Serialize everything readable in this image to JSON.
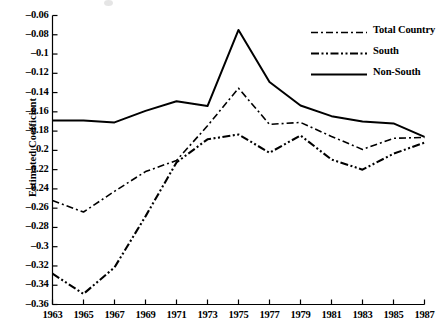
{
  "chart_data": {
    "type": "line",
    "title": "",
    "subtitle": "",
    "xlabel": "",
    "ylabel": "Estimated Coefficient",
    "x": [
      1963,
      1965,
      1967,
      1969,
      1971,
      1973,
      1975,
      1977,
      1979,
      1981,
      1983,
      1985,
      1987
    ],
    "xtick_labels": [
      "1963",
      "1965",
      "1967",
      "1969",
      "1971",
      "1973",
      "1975",
      "1977",
      "1979",
      "1981",
      "1983",
      "1985",
      "1987"
    ],
    "ytick_labels": [
      "-0.06",
      "-0.08",
      "-0.1",
      "-0.12",
      "-0.14",
      "-0.16",
      "-0.18",
      "-0.2",
      "-0.22",
      "-0.24",
      "-0.26",
      "-0.28",
      "-0.3",
      "-0.32",
      "-0.34",
      "-0.36"
    ],
    "ytick_values": [
      -0.06,
      -0.08,
      -0.1,
      -0.12,
      -0.14,
      -0.16,
      -0.18,
      -0.2,
      -0.22,
      -0.24,
      -0.26,
      -0.28,
      -0.3,
      -0.32,
      -0.34,
      -0.36
    ],
    "xlim": [
      1963,
      1987
    ],
    "ylim": [
      -0.36,
      -0.06
    ],
    "grid": false,
    "legend_position": "top-right",
    "series": [
      {
        "name": "Total Country",
        "style": "dash-dot",
        "color": "#000000",
        "width": 1.6,
        "values": [
          -0.252,
          -0.264,
          -0.2425,
          -0.222,
          -0.2105,
          -0.1745,
          -0.1355,
          -0.173,
          -0.171,
          -0.1855,
          -0.199,
          -0.1875,
          -0.1865
        ]
      },
      {
        "name": "South",
        "style": "dash-dot-dot",
        "color": "#000000",
        "width": 2.1,
        "values": [
          -0.328,
          -0.349,
          -0.3215,
          -0.2685,
          -0.2125,
          -0.1885,
          -0.1835,
          -0.2025,
          -0.1845,
          -0.2095,
          -0.22,
          -0.2035,
          -0.192
        ]
      },
      {
        "name": "Non-South",
        "style": "solid",
        "color": "#000000",
        "width": 2.0,
        "values": [
          -0.169,
          -0.169,
          -0.171,
          -0.159,
          -0.149,
          -0.154,
          -0.075,
          -0.129,
          -0.1535,
          -0.1645,
          -0.17,
          -0.172,
          -0.186
        ]
      }
    ]
  },
  "legend": {
    "items": [
      {
        "label": "Total Country",
        "style": "dash-dot"
      },
      {
        "label": "South",
        "style": "dash-dot-dot"
      },
      {
        "label": "Non-South",
        "style": "solid"
      }
    ]
  },
  "axes": {
    "y_axis_title": "Estimated Coefficient"
  }
}
